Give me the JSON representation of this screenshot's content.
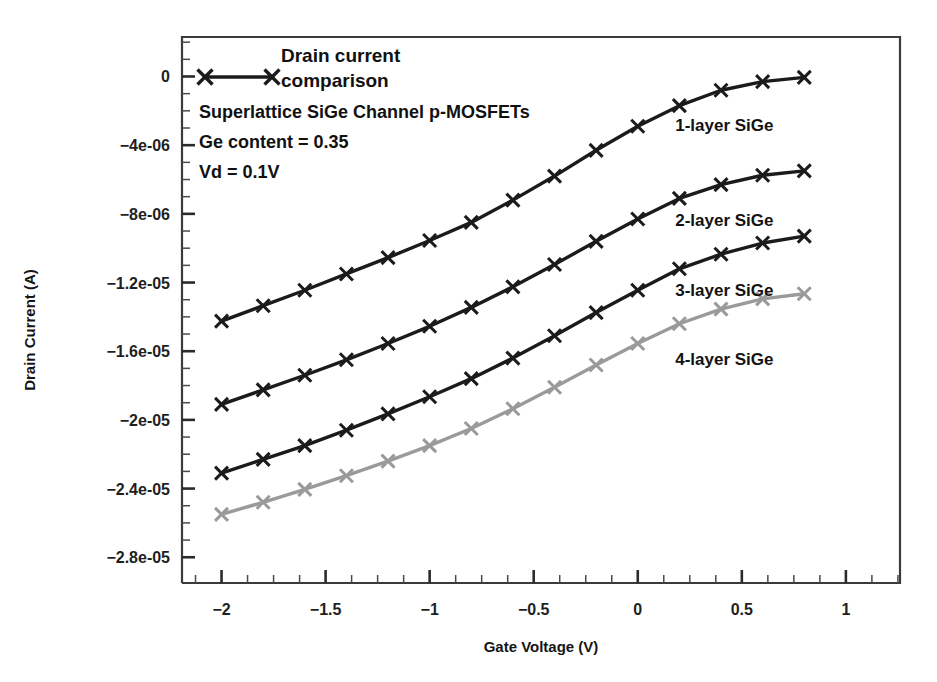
{
  "chart_data": {
    "type": "line",
    "xlabel": "Gate Voltage (V)",
    "ylabel": "Drain Current (A)",
    "xlim": [
      -2.19,
      1.26
    ],
    "ylim": [
      -2.95e-05,
      2.3e-06
    ],
    "grid": false,
    "legend_position": "inside-top-left",
    "x": [
      -2.0,
      -1.8,
      -1.6,
      -1.4,
      -1.2,
      -1.0,
      -0.8,
      -0.6,
      -0.4,
      -0.2,
      0.0,
      0.2,
      0.4,
      0.6,
      0.8
    ],
    "xticks": [
      -2,
      -1.5,
      -1,
      -0.5,
      0,
      0.5,
      1
    ],
    "xticklabels": [
      "−2",
      "−1.5",
      "−1",
      "−0.5",
      "0",
      "0.5",
      "1"
    ],
    "yticks": [
      0,
      -4e-06,
      -8e-06,
      -1.2e-05,
      -1.6e-05,
      -2e-05,
      -2.4e-05,
      -2.8e-05
    ],
    "yticklabels": [
      "0",
      "−4e-06",
      "−8e-06",
      "−1.2e-05",
      "−1.6e-05",
      "−2e-05",
      "−2.4e-05",
      "−2.8e-05"
    ],
    "xminor_per_major": 4,
    "yminor_per_major": 4,
    "series": [
      {
        "name": "1-layer SiGe",
        "color": "#1b1b1b",
        "label_position": {
          "x": 0.18,
          "y": -3.2e-06
        },
        "values": [
          -1.425e-05,
          -1.335e-05,
          -1.245e-05,
          -1.15e-05,
          -1.055e-05,
          -9.55e-06,
          -8.5e-06,
          -7.2e-06,
          -5.8e-06,
          -4.3e-06,
          -2.9e-06,
          -1.7e-06,
          -8e-07,
          -3e-07,
          -5e-08
        ]
      },
      {
        "name": "2-layer SiGe",
        "color": "#1b1b1b",
        "label_position": {
          "x": 0.18,
          "y": -8.7e-06
        },
        "values": [
          -1.91e-05,
          -1.825e-05,
          -1.74e-05,
          -1.65e-05,
          -1.555e-05,
          -1.455e-05,
          -1.345e-05,
          -1.225e-05,
          -1.095e-05,
          -9.6e-06,
          -8.3e-06,
          -7.1e-06,
          -6.3e-06,
          -5.75e-06,
          -5.5e-06
        ]
      },
      {
        "name": "3-layer SiGe",
        "color": "#1b1b1b",
        "label_position": {
          "x": 0.18,
          "y": -1.28e-05
        },
        "values": [
          -2.31e-05,
          -2.23e-05,
          -2.15e-05,
          -2.06e-05,
          -1.965e-05,
          -1.865e-05,
          -1.76e-05,
          -1.64e-05,
          -1.51e-05,
          -1.375e-05,
          -1.245e-05,
          -1.12e-05,
          -1.035e-05,
          -9.7e-06,
          -9.3e-06
        ]
      },
      {
        "name": "4-layer SiGe",
        "color": "#9a9a9a",
        "label_position": {
          "x": 0.18,
          "y": -1.68e-05
        },
        "values": [
          -2.55e-05,
          -2.48e-05,
          -2.405e-05,
          -2.325e-05,
          -2.24e-05,
          -2.15e-05,
          -2.05e-05,
          -1.935e-05,
          -1.81e-05,
          -1.68e-05,
          -1.555e-05,
          -1.44e-05,
          -1.355e-05,
          -1.295e-05,
          -1.265e-05
        ]
      }
    ],
    "annotations": [
      "Superlattice SiGe Channel p-MOSFETs",
      "Ge content = 0.35",
      "Vd = 0.1V"
    ]
  },
  "legend": {
    "title_line1": "Drain current",
    "title_line2": "comparison",
    "sample_color": "#1b1b1b"
  },
  "caption": {
    "line1": "Superlattice SiGe Channel p-MOSFETs",
    "line2": "Ge content = 0.35",
    "line3": "Vd = 0.1V"
  }
}
